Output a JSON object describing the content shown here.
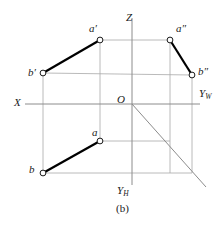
{
  "figure": {
    "caption": "(b)",
    "width": 223,
    "height": 225,
    "background_color": "#ffffff",
    "ink_color": "#1a1a1a",
    "axis_color": "#8c8c8c",
    "construction_color": "#a8a8a8",
    "segment_color": "#000000",
    "point_fill": "#ffffff",
    "point_stroke": "#1a1a1a"
  },
  "axes": {
    "origin_label": "O",
    "x_label": "X",
    "z_label": "Z",
    "yw_label_base": "Y",
    "yw_label_sub": "W",
    "yh_label_base": "Y",
    "yh_label_sub": "H",
    "origin": {
      "x": 132,
      "y": 104
    },
    "x_axis": {
      "x1": 25,
      "y1": 104,
      "x2": 200,
      "y2": 104
    },
    "z_axis": {
      "x1": 132,
      "y1": 18,
      "x2": 132,
      "y2": 185
    },
    "y45_axis": {
      "x1": 132,
      "y1": 104,
      "x2": 206,
      "y2": 187
    }
  },
  "points": [
    {
      "id": "a-prime",
      "label_base": "a",
      "label_prime": "′",
      "x": 100,
      "y": 40,
      "label_x": 89,
      "label_y": 23,
      "view": "frontal"
    },
    {
      "id": "a-double-prime",
      "label_base": "a",
      "label_prime": "″",
      "x": 170,
      "y": 40,
      "label_x": 176,
      "label_y": 23,
      "view": "profile"
    },
    {
      "id": "b-prime",
      "label_base": "b",
      "label_prime": "′",
      "x": 43,
      "y": 73,
      "label_x": 28,
      "label_y": 67,
      "view": "frontal"
    },
    {
      "id": "b-double-prime",
      "label_base": "b",
      "label_prime": "″",
      "x": 192,
      "y": 75,
      "label_x": 198,
      "label_y": 66,
      "view": "profile"
    },
    {
      "id": "a-horizontal",
      "label_base": "a",
      "label_prime": "",
      "x": 100,
      "y": 141,
      "label_x": 92,
      "label_y": 127,
      "view": "horizontal"
    },
    {
      "id": "b-horizontal",
      "label_base": "b",
      "label_prime": "",
      "x": 43,
      "y": 173,
      "label_x": 29,
      "label_y": 164,
      "view": "horizontal"
    }
  ],
  "segments": [
    {
      "id": "segment-ab-frontal",
      "from": "a-prime",
      "to": "b-prime",
      "x1": 100,
      "y1": 40,
      "x2": 43,
      "y2": 73
    },
    {
      "id": "segment-ab-profile",
      "from": "a-double-prime",
      "to": "b-double-prime",
      "x1": 170,
      "y1": 40,
      "x2": 192,
      "y2": 75
    },
    {
      "id": "segment-ab-horizontal",
      "from": "a-horizontal",
      "to": "b-horizontal",
      "x1": 100,
      "y1": 141,
      "x2": 43,
      "y2": 173
    }
  ],
  "construction_lines": [
    {
      "id": "proj-line-a-prime-to-a-double-prime",
      "x1": 100,
      "y1": 40,
      "x2": 170,
      "y2": 40
    },
    {
      "id": "proj-line-b-prime-to-b-double-prime",
      "x1": 43,
      "y1": 73,
      "x2": 192,
      "y2": 75
    },
    {
      "id": "proj-vertical-a",
      "x1": 100,
      "y1": 40,
      "x2": 100,
      "y2": 141
    },
    {
      "id": "proj-vertical-b",
      "x1": 43,
      "y1": 73,
      "x2": 43,
      "y2": 173
    },
    {
      "id": "proj-vertical-a-double-prime",
      "x1": 170,
      "y1": 40,
      "x2": 170,
      "y2": 173
    },
    {
      "id": "proj-vertical-b-double-prime",
      "x1": 192,
      "y1": 75,
      "x2": 192,
      "y2": 173
    },
    {
      "id": "proj-horizontal-a-lower",
      "x1": 100,
      "y1": 141,
      "x2": 170,
      "y2": 141
    },
    {
      "id": "proj-horizontal-b-lower",
      "x1": 43,
      "y1": 173,
      "x2": 192,
      "y2": 173
    }
  ]
}
